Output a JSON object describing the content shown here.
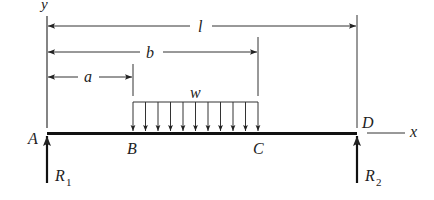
{
  "diagram": {
    "type": "simply-supported beam with partial uniformly distributed load",
    "axes": {
      "x_label": "x",
      "y_label": "y"
    },
    "points": [
      {
        "id": "A",
        "label": "A"
      },
      {
        "id": "B",
        "label": "B"
      },
      {
        "id": "C",
        "label": "C"
      },
      {
        "id": "D",
        "label": "D"
      }
    ],
    "dimensions": [
      {
        "id": "a",
        "label": "a",
        "from": "A",
        "to": "B"
      },
      {
        "id": "b",
        "label": "b",
        "from": "A",
        "to": "C"
      },
      {
        "id": "l",
        "label": "l",
        "from": "A",
        "to": "D"
      }
    ],
    "load": {
      "label": "w",
      "from": "B",
      "to": "C",
      "arrow_count": 11
    },
    "reactions": [
      {
        "id": "R1",
        "label": "R",
        "subscript": "1",
        "at": "A"
      },
      {
        "id": "R2",
        "label": "R",
        "subscript": "2",
        "at": "D"
      }
    ],
    "colors": {
      "line": "#222222",
      "background": "#ffffff"
    }
  }
}
